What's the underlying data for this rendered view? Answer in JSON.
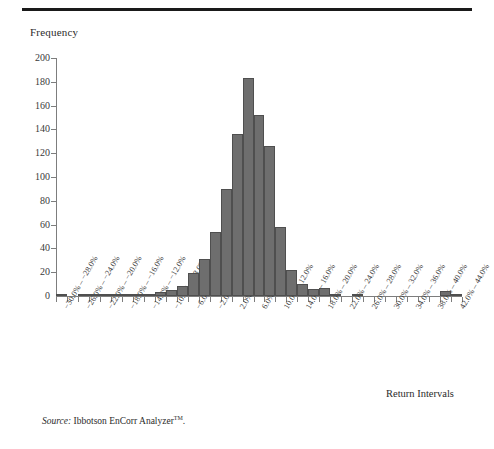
{
  "header": {
    "rule": true
  },
  "axis": {
    "y_title": "Frequency",
    "x_title": "Return Intervals"
  },
  "source": {
    "label": "Source:",
    "text": "Ibbotson EnCorr Analyzer",
    "trademark": "TM",
    "period": "."
  },
  "chart_data": {
    "type": "bar",
    "title": "",
    "subtitle": "",
    "xlabel": "Return Intervals",
    "ylabel": "Frequency",
    "ylim": [
      0,
      200
    ],
    "yticks": [
      0,
      20,
      40,
      60,
      80,
      100,
      120,
      140,
      160,
      180,
      200
    ],
    "grid": false,
    "legend": null,
    "bar_color": "#6e6e6e",
    "bar_edge_color": "#4f4f4f",
    "axis_color": "#7d7d7d",
    "categories": [
      "−30.0% – −28.0%",
      "−28.0% – −26.0%",
      "−26.0% – −24.0%",
      "−24.0% – −22.0%",
      "−22.0% – −20.0%",
      "−20.0% – −18.0%",
      "−18.0% – −16.0%",
      "−16.0% – −14.0%",
      "−14.0% – −12.0%",
      "−12.0% – −10.0%",
      "−10.0% – −8.0%",
      "−8.0% – −6.0%",
      "−6.0% – −4.0%",
      "−4.0% – −2.0%",
      "−2.0% – 0.0%",
      "0.0% – 2.0%",
      "2.0% – 4.0%",
      "4.0% – 6.0%",
      "6.0% – 8.0%",
      "8.0% – 10.0%",
      "10.0% – 12.0%",
      "12.0% – 14.0%",
      "14.0% – 16.0%",
      "16.0% – 18.0%",
      "18.0% – 20.0%",
      "20.0% – 22.0%",
      "22.0% – 24.0%",
      "24.0% – 26.0%",
      "26.0% – 28.0%",
      "28.0% – 30.0%",
      "30.0% – 32.0%",
      "32.0% – 34.0%",
      "34.0% – 36.0%",
      "36.0% – 38.0%",
      "38.0% – 40.0%",
      "40.0% – 42.0%",
      "42.0% – 44.0%"
    ],
    "tick_labels": [
      "−30.0% – −28.0%",
      "−26.0% – −24.0%",
      "−22.0% – −20.0%",
      "−18.0% – −16.0%",
      "−14.0% – −12.0%",
      "−10.0% – −8.0%",
      "−6.0% – −4.0%",
      "−2.0% – 0.0%",
      "2.0% – 4.0%",
      "6.0% – 8.0%",
      "10.0% – 12.0%",
      "14.0% – 16.0%",
      "18.0% – 20.0%",
      "22.0% – 24.0%",
      "26.0% – 28.0%",
      "30.0% – 32.0%",
      "34.0% – 36.0%",
      "38.0% – 40.0%",
      "42.0% – 44.0%"
    ],
    "values": [
      2,
      0,
      1,
      1,
      1,
      2,
      2,
      2,
      2,
      3,
      5,
      8,
      19,
      31,
      54,
      90,
      136,
      183,
      152,
      126,
      58,
      22,
      10,
      6,
      7,
      1,
      0,
      1,
      0,
      0,
      0,
      0,
      0,
      0,
      0,
      4,
      1
    ]
  }
}
